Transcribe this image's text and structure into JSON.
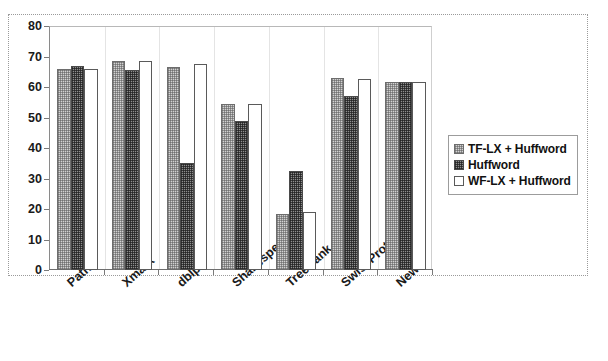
{
  "chart_data": {
    "type": "bar",
    "title": "",
    "subtitle": "",
    "xlabel": "",
    "ylabel": "",
    "ylim": [
      0,
      80
    ],
    "yticks": [
      0,
      10,
      20,
      30,
      40,
      50,
      60,
      70,
      80
    ],
    "grid": false,
    "legend_position": "right",
    "categories": [
      "Path",
      "Xmark",
      "dblp",
      "Shakespeare",
      "TreeBank",
      "SwissProt",
      "News"
    ],
    "series": [
      {
        "name": "TF-LX + Huffword",
        "pattern": "light-checker",
        "color": "#d2d2d2",
        "values": [
          66,
          68.5,
          66.5,
          54.5,
          18.5,
          63,
          61.5
        ]
      },
      {
        "name": "Huffword",
        "pattern": "dark-checker",
        "color": "#8e8e8e",
        "values": [
          67,
          65.5,
          35,
          49,
          32.5,
          57,
          61.5
        ]
      },
      {
        "name": "WF-LX + Huffword",
        "pattern": "white",
        "color": "#ffffff",
        "values": [
          66,
          68.5,
          67.5,
          54.5,
          19,
          62.5,
          61.5
        ]
      }
    ]
  },
  "legend": {
    "items": [
      {
        "label": "TF-LX + Huffword"
      },
      {
        "label": "Huffword"
      },
      {
        "label": "WF-LX + Huffword"
      }
    ]
  },
  "axis": {
    "y_tick_labels": [
      "80",
      "70",
      "60",
      "50",
      "40",
      "30",
      "20",
      "10",
      "0"
    ]
  }
}
